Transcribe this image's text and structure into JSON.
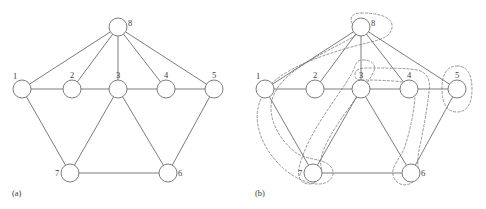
{
  "figure": {
    "background_color": "#ffffff",
    "stroke_color": "#6d6d6d",
    "cluster_color": "#8a8a8a",
    "node_fill": "#ffffff",
    "label_color": "#3b3b3b"
  },
  "panels": [
    {
      "id": "a",
      "caption": "(a)",
      "caption_x": 12,
      "caption_y": 196,
      "show_clusters": false
    },
    {
      "id": "b",
      "caption": "(b)",
      "caption_x": 12,
      "caption_y": 196,
      "show_clusters": true
    }
  ],
  "graph": {
    "node_radius": 9,
    "nodes": [
      {
        "id": "1",
        "label": "1",
        "x": 22,
        "y": 89,
        "label_dx": -9,
        "label_dy": -10
      },
      {
        "id": "2",
        "label": "2",
        "x": 72,
        "y": 89,
        "label_dx": -2,
        "label_dy": -11
      },
      {
        "id": "3",
        "label": "3",
        "x": 118,
        "y": 89,
        "label_dx": -2,
        "label_dy": -11
      },
      {
        "id": "4",
        "label": "4",
        "x": 166,
        "y": 89,
        "label_dx": -2,
        "label_dy": -11
      },
      {
        "id": "5",
        "label": "5",
        "x": 214,
        "y": 89,
        "label_dx": -2,
        "label_dy": -11
      },
      {
        "id": "6",
        "label": "6",
        "x": 168,
        "y": 173,
        "label_dx": 10,
        "label_dy": 3
      },
      {
        "id": "7",
        "label": "7",
        "x": 70,
        "y": 173,
        "label_dx": -15,
        "label_dy": 3
      },
      {
        "id": "8",
        "label": "8",
        "x": 118,
        "y": 27,
        "label_dx": 10,
        "label_dy": -1
      }
    ],
    "edges": [
      {
        "from": "1",
        "to": "2"
      },
      {
        "from": "2",
        "to": "3"
      },
      {
        "from": "3",
        "to": "4"
      },
      {
        "from": "4",
        "to": "5"
      },
      {
        "from": "1",
        "to": "8"
      },
      {
        "from": "2",
        "to": "8"
      },
      {
        "from": "3",
        "to": "8"
      },
      {
        "from": "4",
        "to": "8"
      },
      {
        "from": "5",
        "to": "8"
      },
      {
        "from": "1",
        "to": "7"
      },
      {
        "from": "3",
        "to": "7"
      },
      {
        "from": "3",
        "to": "6"
      },
      {
        "from": "5",
        "to": "6"
      },
      {
        "from": "6",
        "to": "7"
      }
    ],
    "clusters": [
      {
        "id": "cluster-1-8-7",
        "members": [
          "1",
          "8",
          "7"
        ],
        "path": "M 118 13 C 146 13 152 22 148 31 C 144 40 130 41 112 46 C 90 52 58 62 38 76 C 26 84 18 94 15 108 C 11 128 22 152 40 168 C 52 179 70 187 82 183 C 92 179 92 170 86 165 C 78 158 62 160 52 152 C 38 141 28 124 28 108 C 28 94 38 80 54 69 C 74 55 98 44 112 36 C 120 31 108 26 108 20 C 108 15 112 13 118 13 Z"
      },
      {
        "id": "cluster-2-3-7",
        "members": [
          "2",
          "3",
          "7"
        ],
        "path": "M 120 60 C 130 60 134 66 130 73 C 122 88 108 104 96 122 C 84 140 76 156 78 166 C 80 176 74 184 66 184 C 58 184 54 177 56 168 C 60 150 72 128 86 108 C 98 90 110 74 112 66 C 114 61 116 60 120 60 Z"
      },
      {
        "id": "cluster-3-4-6",
        "members": [
          "3",
          "4",
          "6"
        ],
        "path": "M 112 74 C 112 70 116 68 124 68 C 144 68 164 68 174 70 C 184 72 188 80 186 92 C 184 110 180 132 176 150 C 173 164 178 176 170 182 C 162 188 152 184 150 175 C 148 166 158 158 162 146 C 168 128 172 106 172 94 C 172 86 166 82 150 81 C 136 80 124 80 118 80 C 113 80 112 78 112 74 Z"
      },
      {
        "id": "cluster-5",
        "members": [
          "5"
        ],
        "path": "M 214 66 C 224 66 229 74 229 89 C 229 104 224 112 214 112 C 204 112 199 104 199 89 C 199 74 204 66 214 66 Z"
      }
    ]
  }
}
